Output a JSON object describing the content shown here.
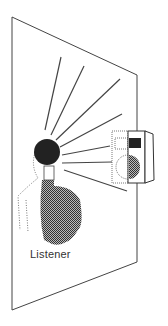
{
  "diagram": {
    "labels": {
      "listener": "Listener"
    },
    "colors": {
      "line": "#444444",
      "head": "#222222",
      "torso": "#666666",
      "speaker_cone": "#555555",
      "tweeter": "#222222"
    },
    "elements": [
      "wall-plane",
      "loudspeaker",
      "listener-head",
      "listener-torso",
      "sound-rays"
    ]
  }
}
